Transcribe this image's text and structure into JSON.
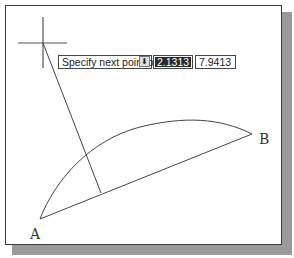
{
  "drawing": {
    "point_labels": {
      "a": "A",
      "b": "B"
    },
    "points": {
      "A": [
        40,
        219
      ],
      "B": [
        252,
        134
      ],
      "cursor": [
        43,
        43
      ],
      "foot": [
        101,
        193
      ]
    },
    "line_color": "#444444"
  },
  "dynamic_input": {
    "prompt": "Specify next point or",
    "options_icon": "down-arrow-icon",
    "first_value": "2.1313",
    "second_value": "7.9413"
  }
}
